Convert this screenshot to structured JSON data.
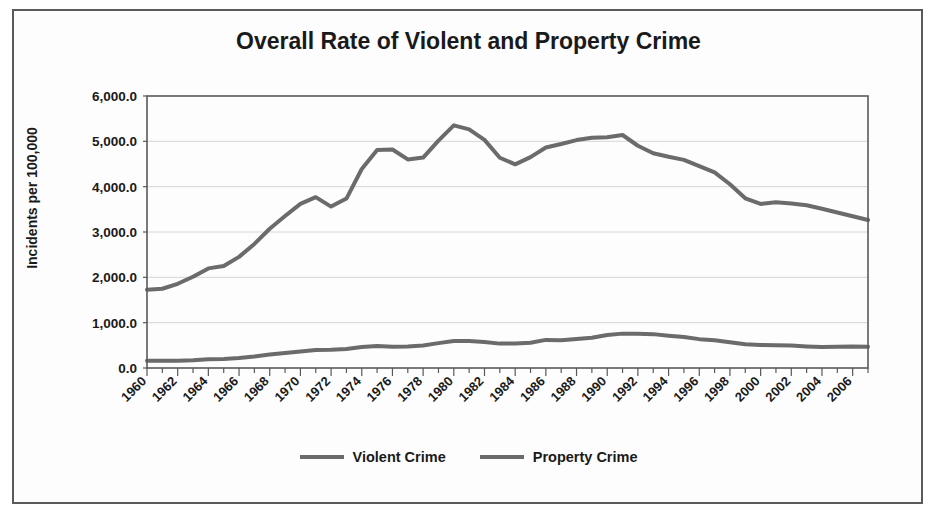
{
  "chart_data": {
    "type": "line",
    "title": "Overall Rate of Violent and Property Crime",
    "xlabel": "",
    "ylabel": "Incidents per 100,000",
    "ylim": [
      0,
      6000
    ],
    "ytick_step": 1000,
    "ytick_labels": [
      "6,000.0",
      "5,000.0",
      "4,000.0",
      "3,000.0",
      "2,000.0",
      "1,000.0",
      "0.0"
    ],
    "grid": true,
    "legend_position": "bottom",
    "line_color": "#6b6b6b",
    "xlim": [
      1960,
      2007
    ],
    "x_label_step": 2,
    "xtick_labels": [
      "1960",
      "1962",
      "1964",
      "1966",
      "1968",
      "1970",
      "1972",
      "1974",
      "1976",
      "1978",
      "1980",
      "1982",
      "1984",
      "1986",
      "1988",
      "1990",
      "1992",
      "1994",
      "1996",
      "1998",
      "2000",
      "2002",
      "2004",
      "2006"
    ],
    "x": [
      1960,
      1961,
      1962,
      1963,
      1964,
      1965,
      1966,
      1967,
      1968,
      1969,
      1970,
      1971,
      1972,
      1973,
      1974,
      1975,
      1976,
      1977,
      1978,
      1979,
      1980,
      1981,
      1982,
      1983,
      1984,
      1985,
      1986,
      1987,
      1988,
      1989,
      1990,
      1991,
      1992,
      1993,
      1994,
      1995,
      1996,
      1997,
      1998,
      1999,
      2000,
      2001,
      2002,
      2003,
      2004,
      2005,
      2006,
      2007
    ],
    "series": [
      {
        "name": "Violent Crime",
        "color": "#6b6b6b",
        "values": [
          160.9,
          158.1,
          162.3,
          168.2,
          190.6,
          200.2,
          220.0,
          253.2,
          298.4,
          328.7,
          363.5,
          396.0,
          401.0,
          417.4,
          461.1,
          487.8,
          467.8,
          475.9,
          497.8,
          548.9,
          596.6,
          594.3,
          571.1,
          537.7,
          539.2,
          556.6,
          620.1,
          612.5,
          640.6,
          666.9,
          729.6,
          758.2,
          757.7,
          747.1,
          713.6,
          684.5,
          636.6,
          611.0,
          567.6,
          523.0,
          506.5,
          504.5,
          494.4,
          475.8,
          463.2,
          469.0,
          473.6,
          466.9
        ]
      },
      {
        "name": "Property Crime",
        "color": "#6b6b6b",
        "values": [
          1726.3,
          1747.9,
          1857.5,
          2012.1,
          2197.5,
          2248.8,
          2450.9,
          2736.5,
          3071.8,
          3351.3,
          3621.0,
          3768.8,
          3560.4,
          3737.0,
          4389.3,
          4810.7,
          4819.5,
          4601.7,
          4642.5,
          5016.6,
          5353.3,
          5263.9,
          5032.5,
          4637.4,
          4492.1,
          4650.5,
          4862.6,
          4940.3,
          5027.1,
          5077.9,
          5088.5,
          5139.7,
          4902.7,
          4737.6,
          4660.0,
          4590.5,
          4451.0,
          4316.3,
          4052.5,
          3743.6,
          3618.3,
          3658.1,
          3630.6,
          3591.2,
          3514.1,
          3431.5,
          3346.6,
          3263.5
        ]
      }
    ]
  },
  "legend": {
    "entries": [
      {
        "label": "Violent Crime"
      },
      {
        "label": "Property Crime"
      }
    ]
  }
}
